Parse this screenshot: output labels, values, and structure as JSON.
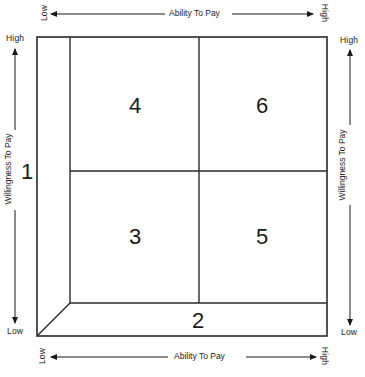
{
  "diagram": {
    "top_axis": {
      "low": "Low",
      "title": "Ability To Pay",
      "high": "High"
    },
    "bottom_axis": {
      "low": "Low",
      "title": "Ability To Pay",
      "high": "High"
    },
    "left_axis": {
      "high": "High",
      "title": "Willingness To Pay",
      "low": "Low"
    },
    "right_axis": {
      "high": "High",
      "title": "Willingness To Pay",
      "low": "Low"
    },
    "regions": [
      {
        "id": "1",
        "label": "1",
        "x": 27,
        "y": 172
      },
      {
        "id": "2",
        "label": "2",
        "x": 198,
        "y": 321
      },
      {
        "id": "3",
        "label": "3",
        "x": 135,
        "y": 237
      },
      {
        "id": "4",
        "label": "4",
        "x": 135,
        "y": 106
      },
      {
        "id": "5",
        "label": "5",
        "x": 262,
        "y": 237
      },
      {
        "id": "6",
        "label": "6",
        "x": 262,
        "y": 106
      }
    ],
    "line_color": "#2a2a2a"
  }
}
